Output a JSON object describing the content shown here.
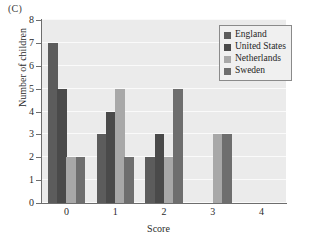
{
  "panel": {
    "label": "(C)"
  },
  "chart_data": {
    "type": "bar",
    "title": "",
    "subtitle": "",
    "panel_label": "(C)",
    "xlabel": "Score",
    "ylabel": "Number of children",
    "categories": [
      "0",
      "1",
      "2",
      "3",
      "4"
    ],
    "ylim": [
      0,
      8
    ],
    "y_ticks": [
      0,
      1,
      2,
      3,
      4,
      5,
      6,
      7,
      8
    ],
    "grid": true,
    "grid_orientation": "horizontal",
    "legend_position": "top-right",
    "series": [
      {
        "name": "England",
        "color": "#5c5c5c",
        "values": [
          7,
          3,
          2,
          0,
          0
        ]
      },
      {
        "name": "United States",
        "color": "#4a4a4a",
        "values": [
          5,
          4,
          3,
          0,
          0
        ]
      },
      {
        "name": "Netherlands",
        "color": "#a8a8a8",
        "values": [
          2,
          5,
          2,
          3,
          0
        ]
      },
      {
        "name": "Sweden",
        "color": "#6e6e6e",
        "values": [
          2,
          2,
          5,
          3,
          0
        ]
      }
    ]
  },
  "legend": {
    "entries": [
      {
        "label": "England",
        "color": "#5c5c5c"
      },
      {
        "label": "United States",
        "color": "#4a4a4a"
      },
      {
        "label": "Netherlands",
        "color": "#a8a8a8"
      },
      {
        "label": "Sweden",
        "color": "#6e6e6e"
      }
    ]
  },
  "colors": {
    "plot_background": "#ebebeb",
    "gridline": "#fafafa",
    "axis": "#6d6d6d",
    "text": "#2b2b2b",
    "legend_border": "#8a8a8a",
    "legend_background": "#f0f0f0"
  }
}
